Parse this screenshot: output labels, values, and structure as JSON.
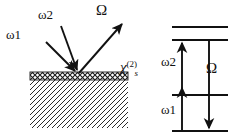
{
  "figure": {
    "canvas": {
      "width": 238,
      "height": 139,
      "background": "#ffffff"
    },
    "stroke_color": "#111111"
  },
  "geometry_panel": {
    "name": "beam-geometry",
    "labels": {
      "omega1": "ω1",
      "omega2": "ω2",
      "big_omega": "Ω",
      "chi": "χ",
      "chi_superscript": "(2)",
      "chi_subscript": "s"
    },
    "surface_point": {
      "x": 78,
      "y": 74
    },
    "beams": [
      {
        "name": "incident-omega1",
        "label": "ω1",
        "direction": "incoming",
        "x1": 48,
        "y1": 44,
        "x2": 78,
        "y2": 74
      },
      {
        "name": "incident-omega2",
        "label": "ω2",
        "direction": "incoming",
        "x1": 62,
        "y1": 28,
        "x2": 78,
        "y2": 74
      },
      {
        "name": "emitted-big-omega",
        "label": "Ω",
        "direction": "outgoing",
        "x1": 78,
        "y1": 74,
        "x2": 124,
        "y2": 22
      }
    ],
    "sample": {
      "name": "nonlinear-medium",
      "x": 30,
      "y": 72,
      "width": 98,
      "height": 56,
      "surface_layer_height": 8,
      "surface_layer_pattern": "cross-hatch",
      "bulk_pattern": "diagonal-hatch"
    }
  },
  "energy_panel": {
    "name": "energy-level-diagram",
    "labels": {
      "omega1": "ω1",
      "omega2": "ω2",
      "big_omega": "Ω"
    },
    "levels": [
      {
        "name": "level-4-top",
        "y": 27,
        "x1": 172,
        "x2": 228
      },
      {
        "name": "level-3-upper",
        "y": 40,
        "x1": 172,
        "x2": 228
      },
      {
        "name": "level-2-middle",
        "y": 95,
        "x1": 172,
        "x2": 228
      },
      {
        "name": "level-1-ground",
        "y": 131,
        "x1": 172,
        "x2": 228
      }
    ],
    "transitions": [
      {
        "name": "absorption-omega2",
        "label": "ω2",
        "x": 182,
        "from_y": 95,
        "to_y": 40,
        "direction": "up"
      },
      {
        "name": "absorption-omega1",
        "label": "ω1",
        "x": 182,
        "from_y": 131,
        "to_y": 95,
        "direction": "up"
      },
      {
        "name": "emission-big-omega",
        "label": "Ω",
        "x": 209,
        "from_y": 40,
        "to_y": 131,
        "direction": "down"
      }
    ]
  }
}
